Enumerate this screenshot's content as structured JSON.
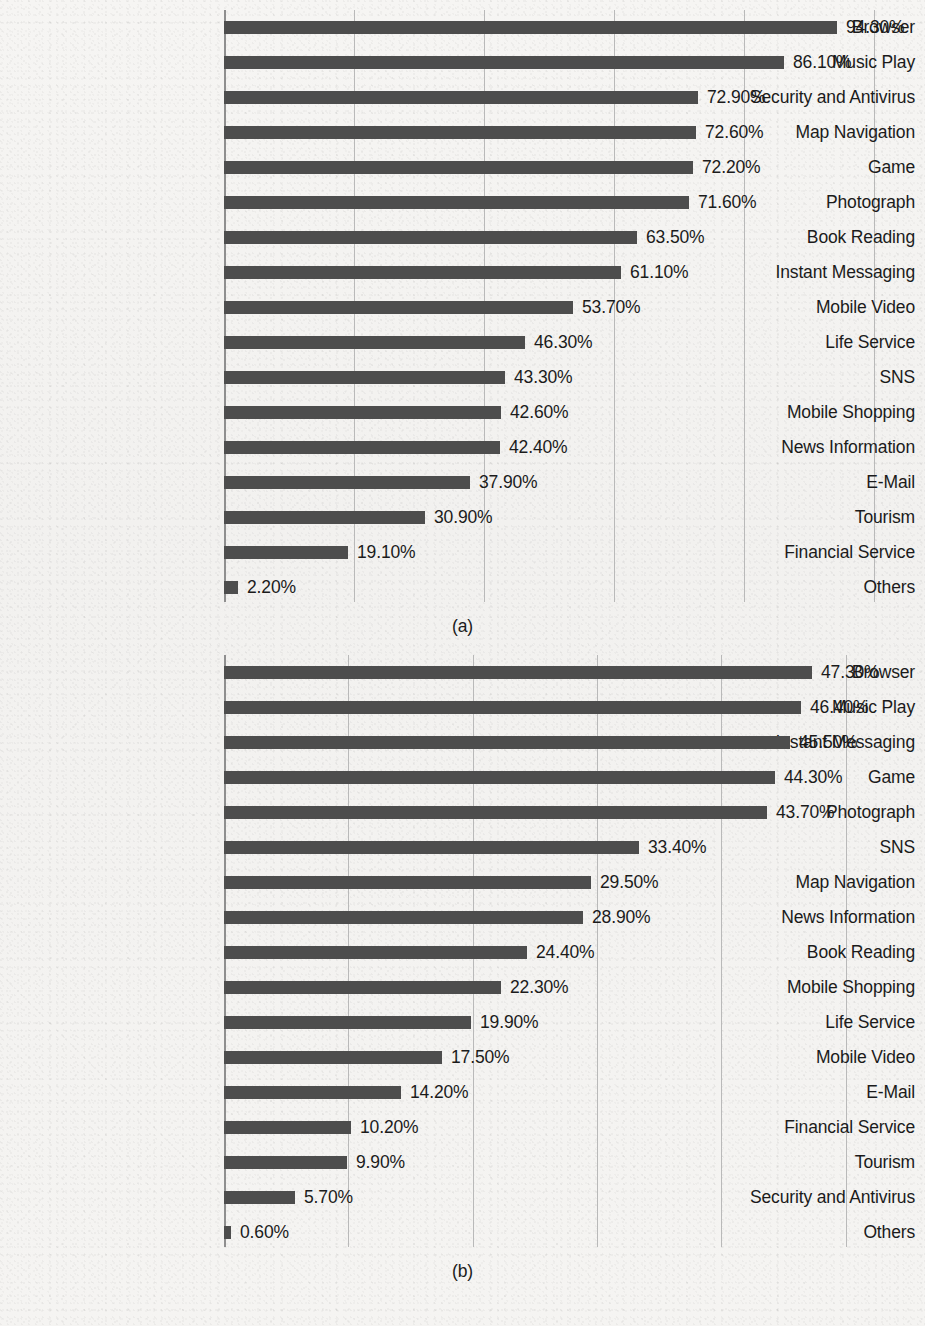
{
  "page": {
    "background_color": "#f4f3f1",
    "bar_color": "#4d4d4d",
    "gridline_color": "#b9b9b9",
    "text_color": "#1b1b1b"
  },
  "figures": [
    {
      "id": "a",
      "caption": "(a)",
      "chart_data": {
        "type": "bar",
        "orientation": "horizontal",
        "title": "",
        "xlabel": "",
        "ylabel": "",
        "xlim": [
          0,
          100
        ],
        "grid": true,
        "gridlines": [
          20,
          40,
          60,
          80,
          100
        ],
        "legend": "none",
        "value_format": "percent_2dp",
        "categories": [
          "Browser",
          "Music Play",
          "Security and Antivirus",
          "Map Navigation",
          "Game",
          "Photograph",
          "Book Reading",
          "Instant Messaging",
          "Mobile Video",
          "Life Service",
          "SNS",
          "Mobile Shopping",
          "News Information",
          "E-Mail",
          "Tourism",
          "Financial Service",
          "Others"
        ],
        "values": [
          94.3,
          86.1,
          72.9,
          72.6,
          72.2,
          71.6,
          63.5,
          61.1,
          53.7,
          46.3,
          43.3,
          42.6,
          42.4,
          37.9,
          30.9,
          19.1,
          2.2
        ],
        "value_labels": [
          "94.30%",
          "86.10%",
          "72.90%",
          "72.60%",
          "72.20%",
          "71.60%",
          "63.50%",
          "61.10%",
          "53.70%",
          "46.30%",
          "43.30%",
          "42.60%",
          "42.40%",
          "37.90%",
          "30.90%",
          "19.10%",
          "2.20%"
        ]
      }
    },
    {
      "id": "b",
      "caption": "(b)",
      "chart_data": {
        "type": "bar",
        "orientation": "horizontal",
        "title": "",
        "xlabel": "",
        "ylabel": "",
        "xlim": [
          0,
          50
        ],
        "grid": true,
        "gridlines": [
          10,
          20,
          30,
          40,
          50
        ],
        "legend": "none",
        "value_format": "percent_2dp",
        "categories": [
          "Browser",
          "Music Play",
          "Instant Messaging",
          "Game",
          "Photograph",
          "SNS",
          "Map Navigation",
          "News Information",
          "Book Reading",
          "Mobile Shopping",
          "Life Service",
          "Mobile Video",
          "E-Mail",
          "Financial Service",
          "Tourism",
          "Security and Antivirus",
          "Others"
        ],
        "values": [
          47.3,
          46.4,
          45.5,
          44.3,
          43.7,
          33.4,
          29.5,
          28.9,
          24.4,
          22.3,
          19.9,
          17.5,
          14.2,
          10.2,
          9.9,
          5.7,
          0.6
        ],
        "value_labels": [
          "47.30%",
          "46.40%",
          "45.50%",
          "44.30%",
          "43.70%",
          "33.40%",
          "29.50%",
          "28.90%",
          "24.40%",
          "22.30%",
          "19.90%",
          "17.50%",
          "14.20%",
          "10.20%",
          "9.90%",
          "5.70%",
          "0.60%"
        ]
      }
    }
  ]
}
